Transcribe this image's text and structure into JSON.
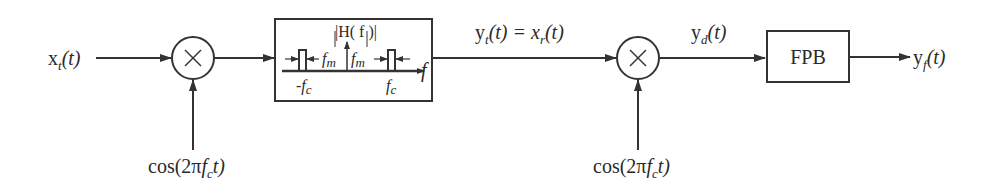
{
  "diagram": {
    "type": "block-diagram",
    "input": {
      "base": "x",
      "sub": "t",
      "arg": "(t)"
    },
    "mixer1": {
      "symbol": "×",
      "osc": {
        "prefix": "cos(2π",
        "f": "f",
        "sub": "c",
        "suffix": "t)"
      }
    },
    "bandpass_filter": {
      "title": "|H( f )|",
      "labels": {
        "fm_left": "f",
        "fm_left_sub": "m",
        "fm_right": "f",
        "fm_right_sub": "m",
        "neg_fc": "-f",
        "neg_fc_sub": "c",
        "pos_fc": "f",
        "pos_fc_sub": "c",
        "axis": "f"
      }
    },
    "transmitted": {
      "lhs": "y",
      "lhs_sub": "t",
      "lhs_arg": "(t) = x",
      "rhs_sub": "r",
      "rhs_arg": "(t)"
    },
    "mixer2": {
      "symbol": "×",
      "osc": {
        "prefix": "cos(2π",
        "f": "f",
        "sub": "c",
        "suffix": "t)"
      }
    },
    "demod": {
      "base": "y",
      "sub": "d",
      "arg": "(t)"
    },
    "lowpass_filter": {
      "label": "FPB"
    },
    "output": {
      "base": "y",
      "sub": "f",
      "arg": "(t)"
    },
    "colors": {
      "stroke": "#333333",
      "background": "#ffffff"
    }
  }
}
